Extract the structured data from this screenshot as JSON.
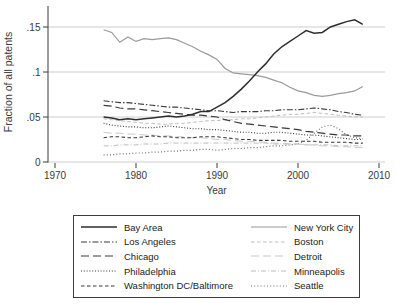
{
  "colors": {
    "background": "#ffffff",
    "grid": "#cdcdcd",
    "axis": "#3a3a3a",
    "text": "#3a3a3a",
    "legend_border": "#3c3c3c"
  },
  "chart_data": {
    "type": "line",
    "xlabel": "Year",
    "ylabel": "Fraction of all patents",
    "xlim": [
      1970,
      2010
    ],
    "ylim": [
      0,
      0.16
    ],
    "grid": true,
    "legend_position": "bottom-box",
    "legend_columns": 2,
    "x_ticks": [
      1970,
      1980,
      1990,
      2000,
      2010
    ],
    "y_ticks": [
      {
        "v": 0,
        "label": "0"
      },
      {
        "v": 0.05,
        "label": ".05"
      },
      {
        "v": 0.1,
        "label": ".1"
      },
      {
        "v": 0.15,
        "label": ".15"
      }
    ],
    "x": [
      1976,
      1977,
      1978,
      1979,
      1980,
      1981,
      1982,
      1983,
      1984,
      1985,
      1986,
      1987,
      1988,
      1989,
      1990,
      1991,
      1992,
      1993,
      1994,
      1995,
      1996,
      1997,
      1998,
      1999,
      2000,
      2001,
      2002,
      2003,
      2004,
      2005,
      2006,
      2007,
      2008
    ],
    "series": [
      {
        "key": "bay-area",
        "name": "Bay Area",
        "color": "#2e2e2e",
        "width": 1.5,
        "dash": "",
        "values": [
          0.05,
          0.049,
          0.047,
          0.048,
          0.047,
          0.048,
          0.049,
          0.05,
          0.051,
          0.05,
          0.051,
          0.053,
          0.056,
          0.056,
          0.061,
          0.066,
          0.073,
          0.081,
          0.09,
          0.1,
          0.109,
          0.12,
          0.128,
          0.134,
          0.14,
          0.146,
          0.143,
          0.144,
          0.15,
          0.153,
          0.156,
          0.158,
          0.153
        ]
      },
      {
        "key": "los-angeles",
        "name": "Los Angeles",
        "color": "#3a3a3a",
        "width": 1.1,
        "dash": "6,2,1.5,2",
        "values": [
          0.068,
          0.067,
          0.066,
          0.066,
          0.065,
          0.064,
          0.063,
          0.062,
          0.061,
          0.061,
          0.06,
          0.059,
          0.058,
          0.057,
          0.057,
          0.056,
          0.055,
          0.056,
          0.056,
          0.056,
          0.057,
          0.057,
          0.058,
          0.058,
          0.058,
          0.059,
          0.06,
          0.059,
          0.058,
          0.056,
          0.055,
          0.053,
          0.052
        ]
      },
      {
        "key": "chicago",
        "name": "Chicago",
        "color": "#3a3a3a",
        "width": 1.2,
        "dash": "8,4",
        "values": [
          0.063,
          0.062,
          0.06,
          0.059,
          0.059,
          0.058,
          0.057,
          0.056,
          0.055,
          0.054,
          0.053,
          0.052,
          0.052,
          0.051,
          0.05,
          0.047,
          0.045,
          0.043,
          0.042,
          0.041,
          0.04,
          0.039,
          0.038,
          0.037,
          0.036,
          0.034,
          0.033,
          0.032,
          0.031,
          0.03,
          0.03,
          0.029,
          0.029
        ]
      },
      {
        "key": "philadelphia",
        "name": "Philadelphia",
        "color": "#3a3a3a",
        "width": 1.1,
        "dash": "1,1.8",
        "values": [
          0.043,
          0.041,
          0.04,
          0.039,
          0.039,
          0.038,
          0.038,
          0.039,
          0.04,
          0.039,
          0.038,
          0.037,
          0.037,
          0.036,
          0.036,
          0.035,
          0.034,
          0.033,
          0.033,
          0.032,
          0.032,
          0.033,
          0.033,
          0.032,
          0.031,
          0.03,
          0.03,
          0.029,
          0.028,
          0.027,
          0.026,
          0.025,
          0.025
        ]
      },
      {
        "key": "washington-dc-baltimore",
        "name": "Washington DC/Baltimore",
        "color": "#3a3a3a",
        "width": 1.1,
        "dash": "3.5,2.5",
        "values": [
          0.027,
          0.028,
          0.028,
          0.027,
          0.027,
          0.028,
          0.029,
          0.028,
          0.028,
          0.027,
          0.027,
          0.027,
          0.028,
          0.028,
          0.028,
          0.027,
          0.026,
          0.025,
          0.025,
          0.024,
          0.024,
          0.024,
          0.024,
          0.023,
          0.023,
          0.023,
          0.023,
          0.022,
          0.022,
          0.022,
          0.022,
          0.021,
          0.021
        ]
      },
      {
        "key": "new-york-city",
        "name": "New York City",
        "color": "#9a9a9a",
        "width": 1.2,
        "dash": "",
        "values": [
          0.147,
          0.144,
          0.133,
          0.139,
          0.134,
          0.137,
          0.136,
          0.137,
          0.138,
          0.136,
          0.132,
          0.128,
          0.123,
          0.119,
          0.114,
          0.104,
          0.099,
          0.098,
          0.097,
          0.096,
          0.094,
          0.091,
          0.088,
          0.083,
          0.079,
          0.077,
          0.074,
          0.073,
          0.074,
          0.076,
          0.077,
          0.079,
          0.084
        ]
      },
      {
        "key": "boston",
        "name": "Boston",
        "color": "#bdbdbd",
        "width": 1,
        "dash": "3.5,2.5",
        "values": [
          0.048,
          0.047,
          0.046,
          0.045,
          0.044,
          0.043,
          0.043,
          0.042,
          0.042,
          0.043,
          0.043,
          0.044,
          0.045,
          0.046,
          0.046,
          0.047,
          0.047,
          0.048,
          0.048,
          0.049,
          0.05,
          0.051,
          0.052,
          0.053,
          0.053,
          0.054,
          0.055,
          0.054,
          0.053,
          0.052,
          0.051,
          0.05,
          0.05
        ]
      },
      {
        "key": "detroit",
        "name": "Detroit",
        "color": "#c9c9c9",
        "width": 1,
        "dash": "8,4",
        "values": [
          0.033,
          0.032,
          0.032,
          0.031,
          0.031,
          0.03,
          0.03,
          0.029,
          0.029,
          0.028,
          0.028,
          0.027,
          0.027,
          0.026,
          0.025,
          0.025,
          0.024,
          0.023,
          0.023,
          0.022,
          0.022,
          0.021,
          0.021,
          0.02,
          0.02,
          0.019,
          0.019,
          0.018,
          0.018,
          0.017,
          0.017,
          0.016,
          0.016
        ]
      },
      {
        "key": "minneapolis",
        "name": "Minneapolis",
        "color": "#bdbdbd",
        "width": 1,
        "dash": "5,2,1,2",
        "values": [
          0.018,
          0.018,
          0.019,
          0.019,
          0.019,
          0.02,
          0.02,
          0.02,
          0.021,
          0.021,
          0.021,
          0.021,
          0.021,
          0.021,
          0.021,
          0.021,
          0.021,
          0.021,
          0.021,
          0.021,
          0.021,
          0.02,
          0.02,
          0.02,
          0.02,
          0.019,
          0.019,
          0.019,
          0.019,
          0.018,
          0.018,
          0.018,
          0.018
        ]
      },
      {
        "key": "seattle",
        "name": "Seattle",
        "color": "#6e6e6e",
        "width": 1.2,
        "dash": "1,2.2",
        "values": [
          0.008,
          0.008,
          0.009,
          0.009,
          0.01,
          0.01,
          0.011,
          0.011,
          0.012,
          0.012,
          0.013,
          0.013,
          0.014,
          0.014,
          0.013,
          0.014,
          0.015,
          0.015,
          0.016,
          0.016,
          0.017,
          0.018,
          0.018,
          0.019,
          0.02,
          0.024,
          0.032,
          0.039,
          0.041,
          0.037,
          0.03,
          0.027,
          0.026
        ]
      }
    ]
  }
}
